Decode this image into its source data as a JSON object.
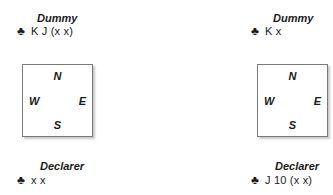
{
  "diagrams": [
    {
      "dummy": {
        "label": "Dummy",
        "suit_symbol": "♣",
        "suit_name": "clubs",
        "cards": "K J (x x)"
      },
      "compass": {
        "north": "N",
        "south": "S",
        "east": "E",
        "west": "W"
      },
      "declarer": {
        "label": "Declarer",
        "suit_symbol": "♣",
        "suit_name": "clubs",
        "cards": "x x"
      }
    },
    {
      "dummy": {
        "label": "Dummy",
        "suit_symbol": "♣",
        "suit_name": "clubs",
        "cards": "K x"
      },
      "compass": {
        "north": "N",
        "south": "S",
        "east": "E",
        "west": "W"
      },
      "declarer": {
        "label": "Declarer",
        "suit_symbol": "♣",
        "suit_name": "clubs",
        "cards": "J 10 (x x)"
      }
    }
  ],
  "colors": {
    "text": "#1a1a1a",
    "box_border": "#7a7a7a",
    "box_shadow": "#c8c8c8",
    "background": "#ffffff"
  }
}
